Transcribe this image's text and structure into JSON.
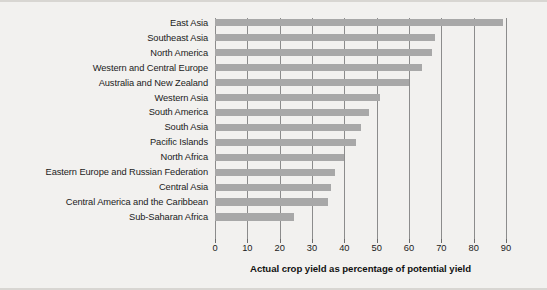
{
  "chart_data": {
    "type": "bar",
    "orientation": "horizontal",
    "title": "",
    "subtitle": "",
    "xlabel": "Actual crop yield as percentage of potential yield",
    "ylabel": "",
    "xlim": [
      0,
      90
    ],
    "xticks": [
      0,
      10,
      20,
      30,
      40,
      50,
      60,
      70,
      80,
      90
    ],
    "xtick_labels": [
      "0",
      "10",
      "20",
      "30",
      "40",
      "50",
      "60",
      "70",
      "80",
      "90"
    ],
    "grid": "vertical",
    "legend": null,
    "bar_color": "#a8a8a8",
    "background_color": "#f2f1ef",
    "gridline_color": "#8c8c8c",
    "categories": [
      "East Asia",
      "Southeast Asia",
      "North America",
      "Western and Central Europe",
      "Australia and New Zealand",
      "Western Asia",
      "South America",
      "South Asia",
      "Pacific Islands",
      "North Africa",
      "Eastern Europe and Russian Federation",
      "Central Asia",
      "Central America and the Caribbean",
      "Sub-Saharan Africa"
    ],
    "values": [
      89,
      68,
      67,
      64,
      60,
      51,
      47.5,
      45,
      43.5,
      40,
      37,
      36,
      35,
      24.5
    ]
  }
}
